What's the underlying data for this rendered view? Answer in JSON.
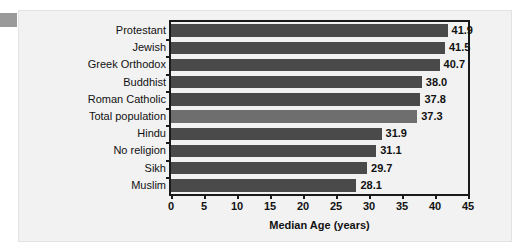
{
  "chart_data": {
    "type": "bar",
    "orientation": "horizontal",
    "title": "",
    "xlabel": "Median Age (years)",
    "ylabel": "",
    "xlim": [
      0,
      45
    ],
    "xticks": [
      0,
      5,
      10,
      15,
      20,
      25,
      30,
      35,
      40,
      45
    ],
    "grid": false,
    "legend": null,
    "categories": [
      "Protestant",
      "Jewish",
      "Greek Orthodox",
      "Buddhist",
      "Roman Catholic",
      "Total population",
      "Hindu",
      "No religion",
      "Sikh",
      "Muslim"
    ],
    "values": [
      41.9,
      41.5,
      40.7,
      38.0,
      37.8,
      37.3,
      31.9,
      31.1,
      29.7,
      28.1
    ],
    "value_labels": [
      "41.9",
      "41.5",
      "40.7",
      "38.0",
      "37.8",
      "37.3",
      "31.9",
      "31.1",
      "29.7",
      "28.1"
    ],
    "highlight_index": 5,
    "colors": {
      "bar": "#4a4a4a",
      "bar_highlight": "#6e6e6e",
      "frame": "#1a1a1a",
      "background": "#f2f2f2",
      "page": "#ffffff",
      "side_tab": "#9a9a9a"
    }
  }
}
